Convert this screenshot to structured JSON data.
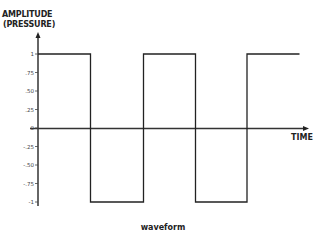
{
  "chart_data": {
    "type": "line",
    "subtype": "square-wave",
    "title": "waveform",
    "xlabel": "TIME",
    "ylabel_line1": "AMPLITUDE",
    "ylabel_line2": "(PRESSURE)",
    "ylim": [
      -1,
      1
    ],
    "yticks": [
      "1",
      ".75",
      ".50",
      ".25",
      "0",
      "-.25",
      "-.50",
      "-.75",
      "-1"
    ],
    "ytick_values": [
      1,
      0.75,
      0.5,
      0.25,
      0,
      -0.25,
      -0.5,
      -0.75,
      -1
    ],
    "grid": false,
    "legend": null,
    "series": [
      {
        "name": "square wave",
        "points": [
          {
            "t": 0,
            "y": 1
          },
          {
            "t": 1,
            "y": 1
          },
          {
            "t": 1,
            "y": -1
          },
          {
            "t": 2,
            "y": -1
          },
          {
            "t": 2,
            "y": 1
          },
          {
            "t": 3,
            "y": 1
          },
          {
            "t": 3,
            "y": -1
          },
          {
            "t": 4,
            "y": -1
          },
          {
            "t": 4,
            "y": 1
          },
          {
            "t": 5,
            "y": 1
          }
        ]
      }
    ],
    "color": "#222222"
  }
}
